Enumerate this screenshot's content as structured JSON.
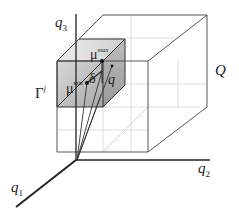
{
  "diagram": {
    "axes": {
      "q1": {
        "name": "q",
        "sub": "1"
      },
      "q2": {
        "name": "q",
        "sub": "2"
      },
      "q3": {
        "name": "q",
        "sub": "3"
      }
    },
    "labels": {
      "Q": "Q",
      "gamma": {
        "base": "Γ",
        "sup": "j"
      },
      "mu_max": {
        "base": "μ",
        "sup": "max"
      },
      "mu_min": {
        "base": "μ",
        "sup": "min"
      },
      "delta": "δ",
      "q": "q"
    },
    "colors": {
      "line": "#333333",
      "grid": "#c8c8c8",
      "shade_light": "#e4e4e4",
      "shade_dark": "#a8a8a8"
    }
  }
}
